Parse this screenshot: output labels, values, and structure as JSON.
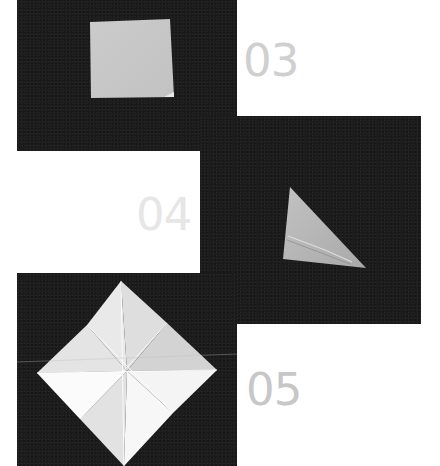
{
  "steps": [
    {
      "number": "03",
      "shape": "square",
      "paper_color": "#c8c8c8",
      "label_color": "#cfcfcf"
    },
    {
      "number": "04",
      "shape": "triangle",
      "paper_color": "#b9b9b9",
      "label_color": "#e6e6e6"
    },
    {
      "number": "05",
      "shape": "creased-diamond",
      "paper_color": "#f2f2f2",
      "label_color": "#c7c7c7"
    }
  ],
  "colors": {
    "background": "#ffffff",
    "panel": "#1d1d1d"
  }
}
